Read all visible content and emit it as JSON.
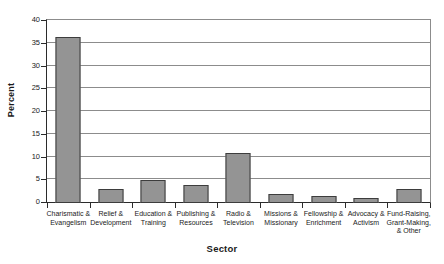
{
  "chart_data": {
    "type": "bar",
    "title": "",
    "xlabel": "Sector",
    "ylabel": "Percent",
    "categories": [
      "Charismatic &\nEvangelism",
      "Relief &\nDevelopment",
      "Education &\nTraining",
      "Publishing &\nResources",
      "Radio &\nTelevision",
      "Missions &\nMissionary",
      "Fellowship &\nEnrichment",
      "Advocacy &\nActivism",
      "Fund-Raising,\nGrant-Making,\n& Other"
    ],
    "values": [
      36.5,
      3,
      5,
      4,
      11,
      2,
      1.5,
      1,
      3
    ],
    "ylim": [
      0,
      40
    ],
    "yticks": [
      0,
      5,
      10,
      15,
      20,
      25,
      30,
      35,
      40
    ],
    "ytick_labels": [
      "0",
      "5",
      "10",
      "15",
      "20",
      "25",
      "30",
      "35",
      "40"
    ],
    "grid": true,
    "legend": null,
    "bar_color": "#949494",
    "bar_edge_color": "#3d3d3d",
    "axis_color": "#2b2b2b",
    "grid_color": "#8c8c8c"
  }
}
